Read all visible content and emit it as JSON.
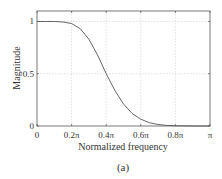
{
  "chart_data": {
    "type": "line",
    "title": "",
    "xlabel": "Normalized frequency",
    "ylabel": "Magnitude",
    "caption": "(a)",
    "xlim": [
      0,
      1
    ],
    "ylim": [
      0,
      1.1
    ],
    "grid": true,
    "x_ticks": [
      0,
      0.2,
      0.4,
      0.6,
      0.8,
      1.0
    ],
    "x_tick_labels": [
      "0",
      "0.2π",
      "0.4π",
      "0.6π",
      "0.8π",
      "π"
    ],
    "y_ticks": [
      0,
      0.5,
      1
    ],
    "y_tick_labels": [
      "0",
      "0.5",
      "1"
    ],
    "series": [
      {
        "name": "magnitude response",
        "x": [
          0,
          0.05,
          0.1,
          0.15,
          0.2,
          0.25,
          0.3,
          0.35,
          0.4,
          0.45,
          0.5,
          0.55,
          0.6,
          0.65,
          0.7,
          0.75,
          0.8,
          0.85,
          0.9,
          0.95,
          1.0
        ],
        "values": [
          1.0,
          1.0,
          1.0,
          0.995,
          0.98,
          0.93,
          0.83,
          0.68,
          0.5,
          0.34,
          0.21,
          0.12,
          0.065,
          0.032,
          0.014,
          0.006,
          0.002,
          0.001,
          0.0,
          0.0,
          0.0
        ]
      }
    ]
  }
}
